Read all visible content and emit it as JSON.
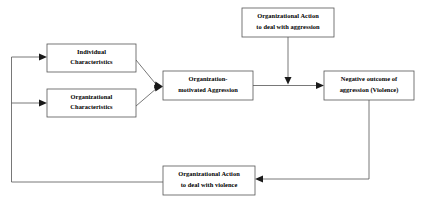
{
  "diagram": {
    "type": "flowchart",
    "background_color": "#ffffff",
    "box_border_color": "#555555",
    "box_fill_color": "#ffffff",
    "line_color": "#555555",
    "arrowhead_color": "#1a1a1a",
    "text_color": "#000000",
    "nodes": [
      {
        "id": "individual-characteristics",
        "line1": "Individual",
        "line2": "Characteristics",
        "x": 47,
        "y": 44,
        "w": 89,
        "h": 28
      },
      {
        "id": "organizational-characteristics",
        "line1": "Organizational",
        "line2": "Characteristics",
        "x": 47,
        "y": 89,
        "w": 89,
        "h": 28
      },
      {
        "id": "organization-motivated-aggression",
        "line1": "Organization-",
        "line2": "motivated Aggression",
        "x": 163,
        "y": 71,
        "w": 90,
        "h": 29
      },
      {
        "id": "organizational-action-aggression",
        "line1": "Organizational Action",
        "line2": "to deal with aggression",
        "x": 242,
        "y": 8,
        "w": 92,
        "h": 29
      },
      {
        "id": "negative-outcome-violence",
        "line1": "Negative outcome of",
        "line2": "aggression (Violence)",
        "x": 324,
        "y": 71,
        "w": 90,
        "h": 29
      },
      {
        "id": "organizational-action-violence",
        "line1": "Organizational Action",
        "line2": "to deal with violence",
        "x": 163,
        "y": 166,
        "w": 92,
        "h": 29
      }
    ],
    "edges": [
      {
        "id": "individual-to-aggression",
        "from": "individual-characteristics",
        "to": "organization-motivated-aggression",
        "shape": "diagonal"
      },
      {
        "id": "organizational-to-aggression",
        "from": "organizational-characteristics",
        "to": "organization-motivated-aggression",
        "shape": "diagonal"
      },
      {
        "id": "aggression-to-negative-outcome",
        "from": "organization-motivated-aggression",
        "to": "negative-outcome-violence",
        "shape": "horizontal"
      },
      {
        "id": "action-aggression-to-link",
        "from": "organizational-action-aggression",
        "to": "aggression-to-negative-outcome",
        "shape": "vertical"
      },
      {
        "id": "negative-outcome-to-action-violence",
        "from": "negative-outcome-violence",
        "to": "organizational-action-violence",
        "shape": "elbow"
      },
      {
        "id": "action-violence-to-individual",
        "from": "organizational-action-violence",
        "to": "individual-characteristics",
        "shape": "feedback-elbow"
      },
      {
        "id": "action-violence-to-organizational",
        "from": "organizational-action-violence",
        "to": "organizational-characteristics",
        "shape": "feedback-elbow"
      }
    ]
  }
}
